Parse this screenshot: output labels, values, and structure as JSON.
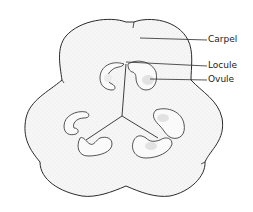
{
  "diagram": {
    "labels": [
      {
        "id": "carpel",
        "text": "Carpel"
      },
      {
        "id": "locule",
        "text": "Locule"
      },
      {
        "id": "ovule",
        "text": "Ovule"
      }
    ],
    "colors": {
      "outline": "#2a2a2a",
      "fill": "#f3f3f3",
      "ovule": "#e2e2e2",
      "background": "#ffffff"
    }
  }
}
